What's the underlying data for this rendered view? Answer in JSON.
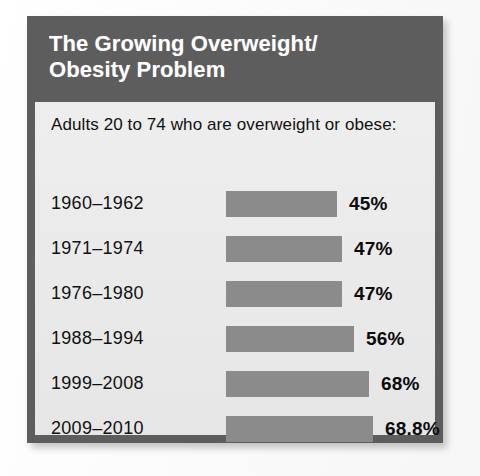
{
  "card": {
    "title_line_1": "The Growing Overweight/",
    "title_line_2": "Obesity Problem",
    "subtitle": "Adults 20 to 74 who are overweight or obese:"
  },
  "background_text": {
    "ghost_1": "",
    "ghost_2": ""
  },
  "colors": {
    "header_background": "#5d5d5d",
    "panel_background": "#ebebeb",
    "bar_fill": "#8b8b8b",
    "title_text": "#ffffff",
    "body_text": "#111111",
    "page_background": "#fdfdfd"
  },
  "chart_data": {
    "type": "bar",
    "title": "The Growing Overweight/ Obesity Problem",
    "subtitle": "Adults 20 to 74 who are overweight or obese:",
    "orientation": "horizontal",
    "xlabel": "",
    "ylabel": "",
    "xlim": [
      0,
      100
    ],
    "grid": false,
    "legend": false,
    "categories": [
      "1960–1962",
      "1971–1974",
      "1976–1980",
      "1988–1994",
      "1999–2008",
      "2009–2010"
    ],
    "values": [
      45,
      47,
      47,
      56,
      68,
      68.8
    ],
    "value_labels": [
      "45%",
      "47%",
      "47%",
      "56%",
      "68%",
      "68.8%"
    ],
    "rows": [
      {
        "label": "1960–1962",
        "value": 45,
        "value_label": "45%",
        "bar_px": 111
      },
      {
        "label": "1971–1974",
        "value": 47,
        "value_label": "47%",
        "bar_px": 116
      },
      {
        "label": "1976–1980",
        "value": 47,
        "value_label": "47%",
        "bar_px": 116
      },
      {
        "label": "1988–1994",
        "value": 56,
        "value_label": "56%",
        "bar_px": 128
      },
      {
        "label": "1999–2008",
        "value": 68,
        "value_label": "68%",
        "bar_px": 143
      },
      {
        "label": "2009–2010",
        "value": 68.8,
        "value_label": "68.8%",
        "bar_px": 147
      }
    ]
  }
}
